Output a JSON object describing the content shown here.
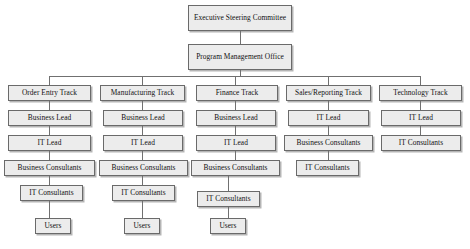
{
  "diagram": {
    "type": "org-chart",
    "box_fill": "#ececec",
    "box_border": "#6a6a6a",
    "connector_color": "#707070",
    "background": "#ffffff"
  },
  "top": {
    "executive": "Executive Steering Committee",
    "pmo": "Program Management Office"
  },
  "tracks": [
    {
      "id": "order-entry",
      "label": "Order Entry Track",
      "roles": [
        "Business Lead",
        "IT Lead",
        "Business Consultants",
        "IT Consultants",
        "Users"
      ]
    },
    {
      "id": "manufacturing",
      "label": "Manufacturing Track",
      "roles": [
        "Business Lead",
        "IT Lead",
        "Business Consultants",
        "IT Consultants",
        "Users"
      ]
    },
    {
      "id": "finance",
      "label": "Finance Track",
      "roles": [
        "Business Lead",
        "IT Lead",
        "Business Consultants",
        "IT Consultants",
        "Users"
      ]
    },
    {
      "id": "sales-reporting",
      "label": "Sales/Reporting Track",
      "roles": [
        "IT Lead",
        "Business Consultants",
        "IT Consultants"
      ]
    },
    {
      "id": "technology",
      "label": "Technology Track",
      "roles": [
        "IT Lead",
        "IT Consultants"
      ]
    }
  ]
}
